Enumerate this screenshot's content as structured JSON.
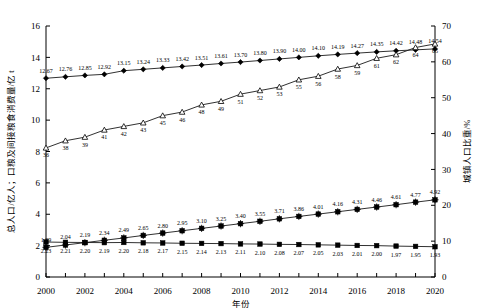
{
  "axes": {
    "left_title": "总人口/亿人；口粮及间接粮食消费量/亿 t",
    "right_title": "城镇人口比重/%",
    "x_title": "年份",
    "left_ticks": [
      "0",
      "2",
      "4",
      "6",
      "8",
      "10",
      "12",
      "14",
      "16"
    ],
    "right_ticks": [
      "0",
      "10",
      "20",
      "30",
      "40",
      "50",
      "60",
      "70"
    ],
    "x_ticks": [
      "2000",
      "2002",
      "2004",
      "2006",
      "2008",
      "2010",
      "2012",
      "2014",
      "2016",
      "2018",
      "2020"
    ]
  },
  "chart_data": {
    "type": "line",
    "title": "",
    "xlabel": "年份",
    "ylabel": "总人口/亿人；口粮及间接粮食消费量/亿 t",
    "y2label": "城镇人口比重/%",
    "ylim": [
      0,
      16
    ],
    "y2lim": [
      0,
      70
    ],
    "grid": false,
    "legend": "none",
    "x": [
      2000,
      2001,
      2002,
      2003,
      2004,
      2005,
      2006,
      2007,
      2008,
      2009,
      2010,
      2011,
      2012,
      2013,
      2014,
      2015,
      2016,
      2017,
      2018,
      2019,
      2020
    ],
    "series": [
      {
        "name": "总人口",
        "marker": "filled-diamond",
        "axis": "left",
        "values": [
          12.67,
          12.76,
          12.85,
          12.92,
          13.15,
          13.24,
          13.33,
          13.42,
          13.51,
          13.61,
          13.7,
          13.8,
          13.9,
          14.0,
          14.1,
          14.19,
          14.27,
          14.35,
          14.42,
          14.48,
          14.54
        ],
        "labels": [
          "12.67",
          "12.76",
          "12.85",
          "12.92",
          "13.15",
          "13.24",
          "13.33",
          "13.42",
          "13.51",
          "13.61",
          "13.70",
          "13.80",
          "13.90",
          "14.00",
          "14.10",
          "14.19",
          "14.27",
          "14.35",
          "14.42",
          "14.48",
          "14.54"
        ]
      },
      {
        "name": "城镇人口比重",
        "marker": "open-triangle",
        "axis": "right",
        "values": [
          36,
          38,
          39,
          41,
          42,
          43,
          45,
          46,
          48,
          49,
          51,
          52,
          53,
          55,
          56,
          58,
          59,
          61,
          62,
          64,
          65
        ],
        "labels": [
          "36",
          "38",
          "39",
          "41",
          "42",
          "43",
          "45",
          "46",
          "48",
          "49",
          "51",
          "52",
          "53",
          "55",
          "56",
          "58",
          "59",
          "61",
          "62",
          "64",
          "65"
        ]
      },
      {
        "name": "间接粮食消费量",
        "marker": "cross-square",
        "axis": "left",
        "values": [
          1.89,
          2.04,
          2.19,
          2.34,
          2.49,
          2.65,
          2.8,
          2.95,
          3.1,
          3.25,
          3.4,
          3.55,
          3.71,
          3.86,
          4.01,
          4.16,
          4.31,
          4.46,
          4.61,
          4.77,
          4.92
        ],
        "labels": [
          "1.89",
          "2.04",
          "2.19",
          "2.34",
          "2.49",
          "2.65",
          "2.80",
          "2.95",
          "3.10",
          "3.25",
          "3.40",
          "3.55",
          "3.71",
          "3.86",
          "4.01",
          "4.16",
          "4.31",
          "4.46",
          "4.61",
          "4.77",
          "4.92"
        ]
      },
      {
        "name": "口粮消费量",
        "marker": "filled-square",
        "axis": "left",
        "values": [
          2.23,
          2.21,
          2.2,
          2.19,
          2.2,
          2.18,
          2.17,
          2.15,
          2.14,
          2.13,
          2.11,
          2.1,
          2.08,
          2.07,
          2.05,
          2.03,
          2.01,
          2.0,
          1.97,
          1.95,
          1.93
        ],
        "labels": [
          "2.23",
          "2.21",
          "2.20",
          "2.19",
          "2.20",
          "2.18",
          "2.17",
          "2.15",
          "2.14",
          "2.13",
          "2.11",
          "2.10",
          "2.08",
          "2.07",
          "2.05",
          "2.03",
          "2.01",
          "2.00",
          "1.97",
          "1.95",
          "1.93"
        ]
      }
    ]
  }
}
